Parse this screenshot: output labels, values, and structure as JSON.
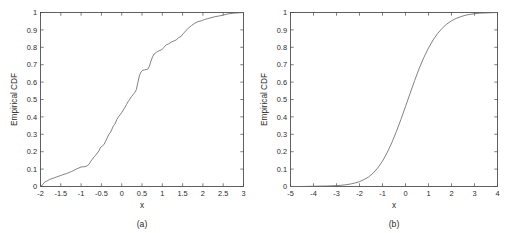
{
  "figure": {
    "background": "#ffffff",
    "axis_color": "#3a3a3a",
    "curve_color": "#6b6b6b",
    "panels": [
      {
        "caption": "(a)",
        "xlabel": "x",
        "ylabel": "Empirical CDF",
        "xticks": [
          "-2",
          "-1.5",
          "-1",
          "-0.5",
          "0",
          "0.5",
          "1",
          "1.5",
          "2",
          "2.5",
          "3"
        ],
        "yticks": [
          "0",
          "0.1",
          "0.2",
          "0.3",
          "0.4",
          "0.5",
          "0.6",
          "0.7",
          "0.8",
          "0.9",
          "1"
        ]
      },
      {
        "caption": "(b)",
        "xlabel": "x",
        "ylabel": "Empirical CDF",
        "xticks": [
          "-5",
          "-4",
          "-3",
          "-2",
          "-1",
          "0",
          "1",
          "2",
          "3",
          "4"
        ],
        "yticks": [
          "0",
          "0.1",
          "0.2",
          "0.3",
          "0.4",
          "0.5",
          "0.6",
          "0.7",
          "0.8",
          "0.9",
          "1"
        ]
      }
    ]
  },
  "chart_data": [
    {
      "type": "line",
      "title": "",
      "subtitle": "",
      "caption": "(a)",
      "xlabel": "x",
      "ylabel": "Empirical CDF",
      "xlim": [
        -2,
        3
      ],
      "ylim": [
        0,
        1
      ],
      "xticks": [
        -2,
        -1.5,
        -1,
        -0.5,
        0,
        0.5,
        1,
        1.5,
        2,
        2.5,
        3
      ],
      "yticks": [
        0,
        0.1,
        0.2,
        0.3,
        0.4,
        0.5,
        0.6,
        0.7,
        0.8,
        0.9,
        1
      ],
      "grid": false,
      "legend": null,
      "annotations": [],
      "series": [
        {
          "name": "Empirical CDF (sample)",
          "x": [
            -2.0,
            -1.94,
            -1.9,
            -1.86,
            -1.82,
            -1.78,
            -1.72,
            -1.66,
            -1.6,
            -1.54,
            -1.48,
            -1.42,
            -1.36,
            -1.3,
            -1.24,
            -1.18,
            -1.12,
            -1.06,
            -1.0,
            -0.96,
            -0.92,
            -0.88,
            -0.84,
            -0.8,
            -0.76,
            -0.72,
            -0.68,
            -0.64,
            -0.6,
            -0.56,
            -0.52,
            -0.48,
            -0.44,
            -0.4,
            -0.36,
            -0.32,
            -0.28,
            -0.24,
            -0.2,
            -0.16,
            -0.12,
            -0.08,
            -0.04,
            0.0,
            0.04,
            0.08,
            0.12,
            0.16,
            0.2,
            0.24,
            0.28,
            0.32,
            0.36,
            0.4,
            0.44,
            0.48,
            0.52,
            0.56,
            0.6,
            0.64,
            0.68,
            0.72,
            0.76,
            0.8,
            0.86,
            0.92,
            0.98,
            1.04,
            1.1,
            1.16,
            1.22,
            1.28,
            1.34,
            1.4,
            1.46,
            1.52,
            1.58,
            1.64,
            1.72,
            1.8,
            1.88,
            1.96,
            2.04,
            2.12,
            2.2,
            2.3,
            2.4,
            2.5,
            2.62,
            2.76,
            2.88,
            3.0
          ],
          "y": [
            0.0,
            0.012,
            0.025,
            0.03,
            0.034,
            0.04,
            0.045,
            0.05,
            0.055,
            0.06,
            0.065,
            0.07,
            0.074,
            0.08,
            0.086,
            0.092,
            0.1,
            0.106,
            0.112,
            0.113,
            0.114,
            0.116,
            0.12,
            0.13,
            0.145,
            0.158,
            0.17,
            0.18,
            0.192,
            0.205,
            0.225,
            0.232,
            0.24,
            0.258,
            0.278,
            0.298,
            0.31,
            0.33,
            0.35,
            0.362,
            0.385,
            0.4,
            0.412,
            0.425,
            0.44,
            0.455,
            0.472,
            0.488,
            0.502,
            0.516,
            0.528,
            0.54,
            0.556,
            0.6,
            0.64,
            0.66,
            0.668,
            0.67,
            0.672,
            0.674,
            0.69,
            0.72,
            0.745,
            0.762,
            0.772,
            0.78,
            0.785,
            0.8,
            0.815,
            0.82,
            0.83,
            0.836,
            0.842,
            0.855,
            0.862,
            0.88,
            0.895,
            0.91,
            0.925,
            0.938,
            0.948,
            0.952,
            0.96,
            0.965,
            0.97,
            0.976,
            0.98,
            0.985,
            0.992,
            0.996,
            0.998,
            1.0
          ]
        }
      ]
    },
    {
      "type": "line",
      "title": "",
      "subtitle": "",
      "caption": "(b)",
      "xlabel": "x",
      "ylabel": "Empirical CDF",
      "xlim": [
        -5,
        4
      ],
      "ylim": [
        0,
        1
      ],
      "xticks": [
        -5,
        -4,
        -3,
        -2,
        -1,
        0,
        1,
        2,
        3,
        4
      ],
      "yticks": [
        0,
        0.1,
        0.2,
        0.3,
        0.4,
        0.5,
        0.6,
        0.7,
        0.8,
        0.9,
        1
      ],
      "grid": false,
      "legend": null,
      "annotations": [],
      "series": [
        {
          "name": "Empirical CDF (normal)",
          "x": [
            -5.0,
            -4.6,
            -4.2,
            -3.8,
            -3.4,
            -3.0,
            -2.8,
            -2.6,
            -2.4,
            -2.2,
            -2.0,
            -1.8,
            -1.6,
            -1.4,
            -1.2,
            -1.0,
            -0.8,
            -0.6,
            -0.4,
            -0.2,
            0.0,
            0.2,
            0.4,
            0.6,
            0.8,
            1.0,
            1.2,
            1.4,
            1.6,
            1.8,
            2.0,
            2.2,
            2.4,
            2.6,
            2.8,
            3.0,
            3.2,
            3.4,
            3.6,
            3.8,
            4.0
          ],
          "y": [
            0.0,
            0.0,
            0.001,
            0.002,
            0.003,
            0.005,
            0.007,
            0.01,
            0.014,
            0.02,
            0.028,
            0.04,
            0.055,
            0.078,
            0.108,
            0.146,
            0.194,
            0.25,
            0.315,
            0.385,
            0.46,
            0.535,
            0.61,
            0.68,
            0.742,
            0.796,
            0.842,
            0.88,
            0.91,
            0.934,
            0.952,
            0.966,
            0.976,
            0.984,
            0.989,
            0.993,
            0.996,
            0.997,
            0.998,
            0.999,
            1.0
          ]
        }
      ]
    }
  ]
}
